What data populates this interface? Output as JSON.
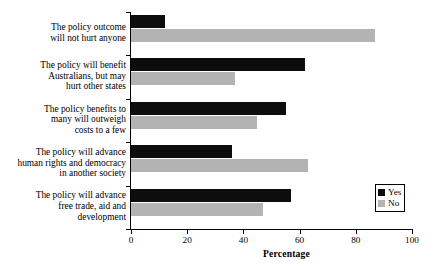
{
  "chart_data": {
    "type": "bar",
    "orientation": "horizontal",
    "title": "",
    "xlabel": "Percentage",
    "ylabel": "",
    "xlim": [
      0,
      100
    ],
    "xticks": [
      0,
      20,
      40,
      60,
      80,
      100
    ],
    "grid": false,
    "legend_position": "right",
    "categories": [
      "The policy outcome\nwill not hurt anyone",
      "The policy will benefit\nAustralians, but may\nhurt other states",
      "The policy benefits to\nmany will outweigh\ncosts to a few",
      "The policy will advance\nhuman rights and democracy\nin another society",
      "The policy will advance\nfree trade, aid and\ndevelopment"
    ],
    "series": [
      {
        "name": "Yes",
        "color": "#0d0d0d",
        "values": [
          12,
          62,
          55,
          36,
          57
        ]
      },
      {
        "name": "No",
        "color": "#b3b3b3",
        "values": [
          87,
          37,
          45,
          63,
          47
        ]
      }
    ]
  }
}
